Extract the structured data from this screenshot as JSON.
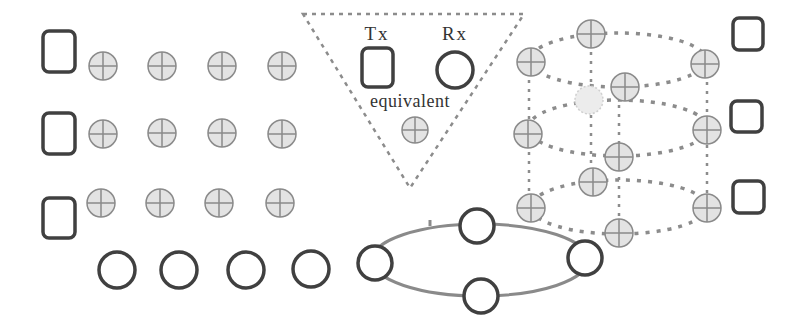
{
  "colors": {
    "stroke_dark": "#404040",
    "node_fill": "#e3e3e3",
    "node_stroke": "#8a8a8a",
    "dash": "#8c8c8c",
    "ring": "#8a8a8a",
    "faded_node": "#ececec"
  },
  "legend": {
    "tx_label": "Tx",
    "rx_label": "Rx",
    "equivalent_label": "equivalent"
  },
  "left_grid": {
    "tx_squares": [
      {
        "x": 43,
        "y": 31,
        "w": 32,
        "h": 41
      },
      {
        "x": 43,
        "y": 113,
        "w": 32,
        "h": 41
      },
      {
        "x": 43,
        "y": 198,
        "w": 32,
        "h": 40
      }
    ],
    "plus_nodes": [
      {
        "cx": 103,
        "cy": 66
      },
      {
        "cx": 162,
        "cy": 66
      },
      {
        "cx": 222,
        "cy": 66
      },
      {
        "cx": 282,
        "cy": 66
      },
      {
        "cx": 103,
        "cy": 134
      },
      {
        "cx": 162,
        "cy": 133
      },
      {
        "cx": 222,
        "cy": 133
      },
      {
        "cx": 282,
        "cy": 134
      },
      {
        "cx": 101,
        "cy": 203
      },
      {
        "cx": 160,
        "cy": 203
      },
      {
        "cx": 219,
        "cy": 203
      },
      {
        "cx": 280,
        "cy": 203
      }
    ],
    "rx_circles": [
      {
        "cx": 117,
        "cy": 270
      },
      {
        "cx": 179,
        "cy": 270
      },
      {
        "cx": 246,
        "cy": 270
      },
      {
        "cx": 311,
        "cy": 269
      }
    ]
  },
  "cylinder": {
    "ellipses": [
      {
        "cx": 618,
        "cy": 60,
        "rx": 88,
        "ry": 27
      },
      {
        "cx": 618,
        "cy": 128,
        "rx": 90,
        "ry": 28
      },
      {
        "cx": 619,
        "cy": 207,
        "rx": 88,
        "ry": 27
      }
    ],
    "verticals": [
      {
        "x": 529,
        "y1": 62,
        "y2": 208
      },
      {
        "x": 591,
        "y1": 34,
        "y2": 182
      },
      {
        "x": 619,
        "y1": 87,
        "y2": 233
      },
      {
        "x": 707,
        "y1": 64,
        "y2": 208
      }
    ],
    "plus_nodes": [
      {
        "cx": 531,
        "cy": 62
      },
      {
        "cx": 591,
        "cy": 34
      },
      {
        "cx": 705,
        "cy": 64
      },
      {
        "cx": 625,
        "cy": 87
      },
      {
        "cx": 528,
        "cy": 134
      },
      {
        "cx": 707,
        "cy": 130
      },
      {
        "cx": 619,
        "cy": 157
      },
      {
        "cx": 531,
        "cy": 208
      },
      {
        "cx": 593,
        "cy": 182
      },
      {
        "cx": 707,
        "cy": 208
      },
      {
        "cx": 619,
        "cy": 233
      }
    ],
    "faded_node": {
      "cx": 589,
      "cy": 100
    },
    "rx_squares": [
      {
        "x": 733,
        "y": 18,
        "w": 30,
        "h": 32
      },
      {
        "x": 731,
        "y": 101,
        "w": 31,
        "h": 31
      },
      {
        "x": 733,
        "y": 181,
        "w": 31,
        "h": 32
      }
    ]
  },
  "ring": {
    "ellipse": {
      "cx": 480,
      "cy": 260,
      "rx": 108,
      "ry": 36
    },
    "rx_circles": [
      {
        "cx": 375,
        "cy": 263
      },
      {
        "cx": 477,
        "cy": 226
      },
      {
        "cx": 585,
        "cy": 258
      },
      {
        "cx": 481,
        "cy": 296
      }
    ]
  }
}
